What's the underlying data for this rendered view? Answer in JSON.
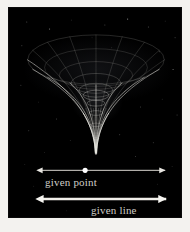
{
  "figure": {
    "kind": "gravitational-funnel-diagram",
    "background_color": "#000000",
    "page_color": "#f3f2ef",
    "ink_color": "#cfcdc8",
    "plate": {
      "x": 8,
      "y": 7,
      "width": 174,
      "height": 211
    }
  },
  "illustration": {
    "name": "funnel-surface",
    "description": "wireframe funnel / gravity well with elliptical rim and long tapering spike",
    "rim": {
      "cx": 88,
      "cy": 52,
      "rx": 69,
      "ry": 25
    },
    "throat": {
      "cx": 88,
      "cy": 88,
      "rx": 13,
      "ry": 5
    },
    "tip": {
      "x": 88,
      "y": 150
    },
    "meridian_count": 16,
    "latitude_rings": [
      {
        "cy": 52,
        "rx": 69,
        "ry": 25,
        "opacity": 0.3
      },
      {
        "cy": 60,
        "rx": 52,
        "ry": 19,
        "opacity": 0.26
      },
      {
        "cy": 68,
        "rx": 37,
        "ry": 14,
        "opacity": 0.28
      },
      {
        "cy": 76,
        "rx": 25,
        "ry": 10,
        "opacity": 0.34
      },
      {
        "cy": 83,
        "rx": 17,
        "ry": 7,
        "opacity": 0.42
      },
      {
        "cy": 88,
        "rx": 13,
        "ry": 5,
        "opacity": 0.55
      },
      {
        "cy": 96,
        "rx": 9,
        "ry": 3,
        "opacity": 0.5
      },
      {
        "cy": 106,
        "rx": 7,
        "ry": 2.4,
        "opacity": 0.45
      },
      {
        "cy": 118,
        "rx": 5,
        "ry": 1.8,
        "opacity": 0.4
      },
      {
        "cy": 132,
        "rx": 3,
        "ry": 1.2,
        "opacity": 0.34
      }
    ]
  },
  "annotations": {
    "given_point": {
      "label": "given point",
      "axis": {
        "x1": 33,
        "x2": 158,
        "y": 164
      },
      "marker": {
        "x": 77,
        "y": 164,
        "r": 2.6,
        "color": "#ffffff"
      },
      "arrow_heads": "both",
      "stroke_width": 1
    },
    "given_line": {
      "label": "given line",
      "axis": {
        "x1": 34,
        "x2": 159,
        "y": 193
      },
      "arrow_heads": "both",
      "stroke_width": 2.4
    }
  },
  "stars": [
    {
      "x": 18,
      "y": 14,
      "r": 0.5,
      "o": 0.45
    },
    {
      "x": 41,
      "y": 21,
      "r": 0.6,
      "o": 0.5
    },
    {
      "x": 63,
      "y": 12,
      "r": 0.4,
      "o": 0.35
    },
    {
      "x": 97,
      "y": 17,
      "r": 0.5,
      "o": 0.4
    },
    {
      "x": 120,
      "y": 11,
      "r": 0.6,
      "o": 0.55
    },
    {
      "x": 141,
      "y": 19,
      "r": 0.5,
      "o": 0.45
    },
    {
      "x": 158,
      "y": 13,
      "r": 0.4,
      "o": 0.35
    },
    {
      "x": 168,
      "y": 30,
      "r": 0.5,
      "o": 0.4
    },
    {
      "x": 13,
      "y": 38,
      "r": 0.5,
      "o": 0.4
    },
    {
      "x": 26,
      "y": 57,
      "r": 0.4,
      "o": 0.3
    },
    {
      "x": 152,
      "y": 44,
      "r": 0.5,
      "o": 0.4
    },
    {
      "x": 166,
      "y": 62,
      "r": 0.6,
      "o": 0.45
    },
    {
      "x": 12,
      "y": 78,
      "r": 0.5,
      "o": 0.35
    },
    {
      "x": 30,
      "y": 95,
      "r": 0.4,
      "o": 0.3
    },
    {
      "x": 48,
      "y": 112,
      "r": 0.5,
      "o": 0.4
    },
    {
      "x": 133,
      "y": 100,
      "r": 0.5,
      "o": 0.4
    },
    {
      "x": 155,
      "y": 92,
      "r": 0.4,
      "o": 0.3
    },
    {
      "x": 170,
      "y": 108,
      "r": 0.5,
      "o": 0.38
    },
    {
      "x": 20,
      "y": 124,
      "r": 0.5,
      "o": 0.35
    },
    {
      "x": 62,
      "y": 134,
      "r": 0.4,
      "o": 0.3
    },
    {
      "x": 112,
      "y": 128,
      "r": 0.5,
      "o": 0.4
    },
    {
      "x": 146,
      "y": 136,
      "r": 0.5,
      "o": 0.35
    },
    {
      "x": 36,
      "y": 146,
      "r": 0.4,
      "o": 0.3
    },
    {
      "x": 128,
      "y": 150,
      "r": 0.5,
      "o": 0.35
    },
    {
      "x": 16,
      "y": 158,
      "r": 0.4,
      "o": 0.28
    },
    {
      "x": 165,
      "y": 160,
      "r": 0.4,
      "o": 0.3
    },
    {
      "x": 25,
      "y": 180,
      "r": 0.4,
      "o": 0.26
    },
    {
      "x": 150,
      "y": 178,
      "r": 0.4,
      "o": 0.28
    },
    {
      "x": 58,
      "y": 205,
      "r": 0.4,
      "o": 0.22
    },
    {
      "x": 108,
      "y": 208,
      "r": 0.4,
      "o": 0.22
    },
    {
      "x": 84,
      "y": 30,
      "r": 0.4,
      "o": 0.3
    },
    {
      "x": 104,
      "y": 40,
      "r": 0.4,
      "o": 0.28
    }
  ]
}
